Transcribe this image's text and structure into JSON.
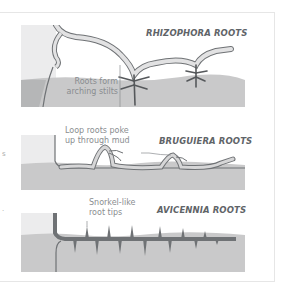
{
  "colors": {
    "sky_tint": "#e9e9ea",
    "mud": "#c9c9ca",
    "mud_dark": "#b9babb",
    "trunk_fill": "#d8d8d9",
    "root_fill": "#e2e2e3",
    "root_outline": "#6f7275",
    "title_text": "#5f6468",
    "callout_text": "#8a8d90"
  },
  "panels": [
    {
      "title": "RHIZOPHORA ROOTS",
      "callout_lines": [
        "Roots form",
        "arching stilts"
      ]
    },
    {
      "title": "BRUGUIERA ROOTS",
      "callout_lines": [
        "Loop roots poke",
        "up through mud"
      ]
    },
    {
      "title": "AVICENNIA ROOTS",
      "callout_lines": [
        "Snorkel-like",
        "root tips"
      ]
    }
  ],
  "stray_marks": [
    "s",
    "."
  ]
}
